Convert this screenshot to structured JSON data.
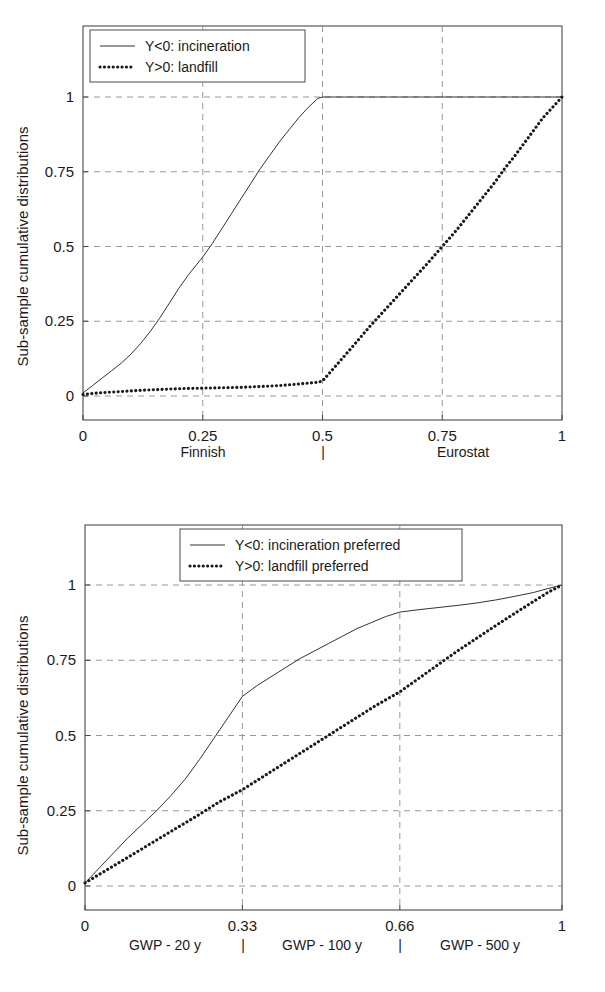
{
  "figures": [
    {
      "id": "finnish-eurostat",
      "y_axis_title": "Sub-sample cumulative distributions",
      "x_tick_labels": [
        "0",
        "0.25",
        "0.5",
        "0.75",
        "1"
      ],
      "y_tick_labels": [
        "0",
        "0.25",
        "0.5",
        "0.75",
        "1"
      ],
      "group_labels": [
        "Finnish",
        "|",
        "Eurostat"
      ],
      "legend": [
        {
          "marker": "solid",
          "label": "Y<0: incineration"
        },
        {
          "marker": "dotted",
          "label": "Y>0: landfill"
        }
      ]
    },
    {
      "id": "gwp-horizons",
      "y_axis_title": "Sub-sample cumulative distributions",
      "x_tick_labels": [
        "0",
        "0.33",
        "0.66",
        "1"
      ],
      "y_tick_labels": [
        "0",
        "0.25",
        "0.5",
        "0.75",
        "1"
      ],
      "group_labels": [
        "GWP - 20 y",
        "|",
        "GWP - 100 y",
        "|",
        "GWP - 500 y"
      ],
      "legend": [
        {
          "marker": "solid",
          "label": "Y<0: incineration preferred"
        },
        {
          "marker": "dotted",
          "label": "Y>0: landfill preferred"
        }
      ]
    }
  ],
  "chart_data": [
    {
      "type": "line",
      "title": "",
      "subtitle": "",
      "xlabel": "",
      "ylabel": "Sub-sample cumulative distributions",
      "xlim": [
        0,
        1
      ],
      "ylim": [
        0,
        1
      ],
      "xticks": [
        0,
        0.25,
        0.5,
        0.75,
        1
      ],
      "yticks": [
        0,
        0.25,
        0.5,
        0.75,
        1
      ],
      "grid": true,
      "legend_position": "top-left",
      "x_group_annotations": [
        "Finnish",
        "|",
        "Eurostat"
      ],
      "series": [
        {
          "name": "Y<0: incineration",
          "style": "solid",
          "color": "#333333",
          "x": [
            0.0,
            0.02,
            0.04,
            0.06,
            0.08,
            0.1,
            0.12,
            0.14,
            0.16,
            0.18,
            0.2,
            0.22,
            0.24,
            0.25,
            0.27,
            0.29,
            0.31,
            0.33,
            0.35,
            0.37,
            0.39,
            0.41,
            0.43,
            0.45,
            0.47,
            0.49,
            0.5,
            0.6,
            0.7,
            0.8,
            0.9,
            1.0
          ],
          "y": [
            0.01,
            0.035,
            0.06,
            0.085,
            0.11,
            0.14,
            0.175,
            0.215,
            0.26,
            0.31,
            0.36,
            0.405,
            0.445,
            0.465,
            0.51,
            0.56,
            0.61,
            0.66,
            0.71,
            0.76,
            0.805,
            0.85,
            0.89,
            0.93,
            0.965,
            0.995,
            1.0,
            1.0,
            1.0,
            1.0,
            1.0,
            1.0
          ]
        },
        {
          "name": "Y>0: landfill",
          "style": "dotted",
          "color": "#1a1a1a",
          "x": [
            0.0,
            0.03,
            0.06,
            0.09,
            0.12,
            0.15,
            0.18,
            0.21,
            0.24,
            0.27,
            0.3,
            0.33,
            0.36,
            0.39,
            0.42,
            0.45,
            0.47,
            0.49,
            0.5,
            0.53,
            0.56,
            0.6,
            0.64,
            0.68,
            0.72,
            0.75,
            0.78,
            0.82,
            0.86,
            0.88,
            0.9,
            0.93,
            0.96,
            1.0
          ],
          "y": [
            0.005,
            0.01,
            0.013,
            0.016,
            0.019,
            0.021,
            0.023,
            0.025,
            0.026,
            0.027,
            0.028,
            0.029,
            0.031,
            0.033,
            0.036,
            0.04,
            0.043,
            0.046,
            0.05,
            0.105,
            0.16,
            0.235,
            0.305,
            0.375,
            0.445,
            0.5,
            0.555,
            0.635,
            0.715,
            0.76,
            0.8,
            0.865,
            0.93,
            1.0
          ]
        }
      ]
    },
    {
      "type": "line",
      "title": "",
      "subtitle": "",
      "xlabel": "",
      "ylabel": "Sub-sample cumulative distributions",
      "xlim": [
        0,
        1
      ],
      "ylim": [
        0,
        1
      ],
      "xticks": [
        0,
        0.33,
        0.66,
        1
      ],
      "yticks": [
        0,
        0.25,
        0.5,
        0.75,
        1
      ],
      "grid": true,
      "legend_position": "top-center",
      "x_group_annotations": [
        "GWP - 20 y",
        "|",
        "GWP - 100 y",
        "|",
        "GWP - 500 y"
      ],
      "series": [
        {
          "name": "Y<0: incineration preferred",
          "style": "solid",
          "color": "#333333",
          "x": [
            0.0,
            0.03,
            0.06,
            0.09,
            0.12,
            0.15,
            0.18,
            0.21,
            0.24,
            0.27,
            0.3,
            0.33,
            0.36,
            0.39,
            0.42,
            0.45,
            0.48,
            0.51,
            0.54,
            0.57,
            0.6,
            0.63,
            0.66,
            0.7,
            0.74,
            0.78,
            0.82,
            0.86,
            0.9,
            0.94,
            0.97,
            1.0
          ],
          "y": [
            0.01,
            0.06,
            0.11,
            0.16,
            0.205,
            0.25,
            0.3,
            0.355,
            0.42,
            0.49,
            0.56,
            0.63,
            0.665,
            0.695,
            0.725,
            0.755,
            0.78,
            0.805,
            0.83,
            0.855,
            0.875,
            0.895,
            0.91,
            0.918,
            0.925,
            0.932,
            0.94,
            0.95,
            0.962,
            0.975,
            0.988,
            1.0
          ]
        },
        {
          "name": "Y>0: landfill preferred",
          "style": "dotted",
          "color": "#1a1a1a",
          "x": [
            0.0,
            0.04,
            0.08,
            0.12,
            0.16,
            0.2,
            0.24,
            0.28,
            0.33,
            0.37,
            0.41,
            0.45,
            0.49,
            0.53,
            0.57,
            0.61,
            0.66,
            0.7,
            0.74,
            0.78,
            0.82,
            0.86,
            0.9,
            0.94,
            0.97,
            1.0
          ],
          "y": [
            0.01,
            0.048,
            0.086,
            0.124,
            0.162,
            0.2,
            0.238,
            0.278,
            0.32,
            0.36,
            0.4,
            0.44,
            0.48,
            0.52,
            0.56,
            0.6,
            0.645,
            0.69,
            0.735,
            0.78,
            0.822,
            0.864,
            0.905,
            0.945,
            0.975,
            1.0
          ]
        }
      ]
    }
  ]
}
